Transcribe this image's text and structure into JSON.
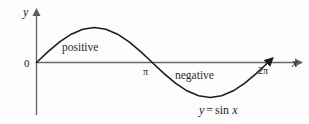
{
  "figure": {
    "caption_equation": "y = sin x",
    "background_color": "#fdfdfd",
    "curve_color": "#1c1c1c",
    "axis_color": "#6b6b6b"
  },
  "axes": {
    "x_label": "x",
    "y_label": "y",
    "origin_label": "0"
  },
  "ticks": {
    "pi": "π",
    "two_pi": "2π"
  },
  "annotations": {
    "positive": "positive",
    "negative": "negative"
  },
  "equation": {
    "lhs": "y",
    "operator": "=",
    "fn": "sin",
    "arg": "x"
  },
  "chart_data": {
    "type": "line",
    "title": "",
    "subtitle": "",
    "xlabel": "x",
    "ylabel": "y",
    "grid": false,
    "legend": false,
    "annotations": [
      {
        "text": "positive",
        "x": 1.5708,
        "y": 0.55,
        "note": "region where sin x > 0, between 0 and pi"
      },
      {
        "text": "negative",
        "x": 4.3,
        "y": -0.27,
        "note": "region where sin x < 0, between pi and 2pi"
      },
      {
        "text": "y = sin x",
        "x": 5.1,
        "y": -1.35,
        "note": "curve equation label"
      }
    ],
    "xlim": [
      0,
      6.6
    ],
    "ylim": [
      -1.35,
      1.35
    ],
    "xtick_values": [
      0,
      3.14159,
      6.28319
    ],
    "xtick_labels": [
      "0",
      "π",
      "2π"
    ],
    "ytick_values": [],
    "ytick_labels": [],
    "series": [
      {
        "name": "y = sin x",
        "color": "#1c1c1c",
        "x": [
          0,
          0.31416,
          0.62832,
          0.94248,
          1.25664,
          1.5708,
          1.88496,
          2.19911,
          2.51327,
          2.82743,
          3.14159,
          3.45575,
          3.76991,
          4.08407,
          4.39823,
          4.71239,
          5.02655,
          5.34071,
          5.65487,
          5.96903,
          6.28319
        ],
        "y": [
          0,
          0.30902,
          0.58779,
          0.80902,
          0.95106,
          1,
          0.95106,
          0.80902,
          0.58779,
          0.30902,
          0,
          -0.30902,
          -0.58779,
          -0.80902,
          -0.95106,
          -1,
          -0.95106,
          -0.80902,
          -0.58779,
          -0.30902,
          0
        ]
      }
    ]
  }
}
